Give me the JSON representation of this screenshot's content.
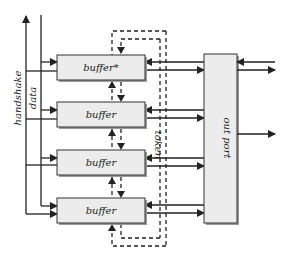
{
  "diagram": {
    "buffers": [
      {
        "label": "buffer*"
      },
      {
        "label": "buffer"
      },
      {
        "label": "buffer"
      },
      {
        "label": "buffer"
      }
    ],
    "out_port": {
      "label": "out port"
    },
    "labels": {
      "handshake": "handshake",
      "data": "data",
      "token": "token"
    },
    "colors": {
      "box_fill": "#ececec",
      "box_stroke": "#333333",
      "shadow": "#9a9a9a",
      "line": "#222222"
    }
  }
}
